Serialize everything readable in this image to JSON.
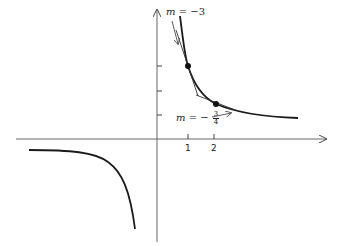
{
  "diagram": {
    "type": "hyperbola-with-tangents",
    "axes": {
      "x_ticks": [
        "1",
        "2"
      ],
      "y_tick_count": 3
    },
    "curve": "y = k/x (both branches)",
    "tangent_labels": {
      "upper": {
        "var": "m",
        "eq": "=",
        "value": "−3"
      },
      "lower": {
        "var": "m",
        "eq": "=",
        "sign": "−",
        "num": "3",
        "den": "4"
      }
    },
    "points": [
      {
        "x": 1,
        "label": "m = -3"
      },
      {
        "x": 2,
        "label": "m = -3/4"
      }
    ],
    "colors": {
      "ink": "#1a1a1a",
      "axis": "#555555"
    }
  }
}
